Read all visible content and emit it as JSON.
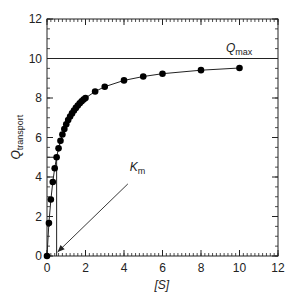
{
  "chart_data": {
    "type": "scatter",
    "title": "",
    "xlabel": "[S]",
    "ylabel": "Q",
    "ylabel_subscript": "transport",
    "xlim": [
      0,
      12
    ],
    "ylim": [
      0,
      12
    ],
    "x_ticks": [
      0,
      2,
      4,
      6,
      8,
      10,
      12
    ],
    "y_ticks": [
      0,
      2,
      4,
      6,
      8,
      10,
      12
    ],
    "x_minor_step": 0.2,
    "y_minor_step": 0.5,
    "grid": false,
    "legend": null,
    "series": [
      {
        "name": "Q_transport data",
        "marker": "filled-circle",
        "connected": true,
        "x": [
          0,
          0.1,
          0.2,
          0.3,
          0.4,
          0.5,
          0.6,
          0.7,
          0.8,
          0.9,
          1.0,
          1.1,
          1.2,
          1.3,
          1.4,
          1.5,
          1.6,
          1.7,
          1.8,
          1.9,
          2.0,
          2.5,
          3,
          4,
          5,
          6,
          8,
          10
        ],
        "y": [
          0,
          1.67,
          2.86,
          3.75,
          4.44,
          5.0,
          5.45,
          5.83,
          6.15,
          6.43,
          6.67,
          6.88,
          7.06,
          7.22,
          7.37,
          7.5,
          7.62,
          7.73,
          7.83,
          7.92,
          8.0,
          8.33,
          8.57,
          8.89,
          9.09,
          9.23,
          9.41,
          9.52
        ]
      }
    ],
    "reference_lines": [
      {
        "name": "Qmax",
        "orientation": "horizontal",
        "y": 10,
        "x_range": [
          0,
          11.7
        ]
      },
      {
        "name": "Km-vertical",
        "orientation": "vertical",
        "x": 0.5,
        "y_range": [
          0,
          5
        ]
      },
      {
        "name": "half-Qmax",
        "orientation": "horizontal",
        "y": 5,
        "x_range": [
          0,
          0.5
        ]
      }
    ],
    "annotations": [
      {
        "text": "Q",
        "subscript": "max",
        "x": 9.3,
        "y": 10.35
      },
      {
        "text": "K",
        "subscript": "m",
        "x": 4.3,
        "y": 4.3,
        "arrow_to": [
          0.55,
          0.2
        ],
        "arrow_from": [
          4.2,
          3.65
        ]
      }
    ]
  },
  "labels": {
    "qmax_main": "Q",
    "qmax_sub": "max",
    "km_main": "K",
    "km_sub": "m",
    "xlabel": "[S]",
    "ylabel_main": "Q",
    "ylabel_sub": "transport"
  }
}
